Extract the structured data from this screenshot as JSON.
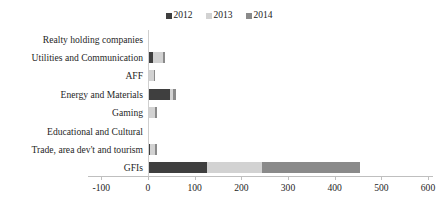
{
  "chart_data": {
    "type": "bar",
    "orientation": "horizontal",
    "stacked": true,
    "title": "",
    "xlabel": "",
    "ylabel": "",
    "xlim": [
      -100,
      600
    ],
    "xticks": [
      -100,
      0,
      100,
      200,
      300,
      400,
      500,
      600
    ],
    "xtick_labels": [
      "-100",
      "0",
      "100",
      "200",
      "300",
      "400",
      "500",
      "600"
    ],
    "grid": false,
    "legend_position": "top-center",
    "categories": [
      "Realty holding companies",
      "Utilities and Communication",
      "AFF",
      "Energy and Materials",
      "Gaming",
      "Educational and Cultural",
      "Trade, area dev't and tourism",
      "GFIs"
    ],
    "series": [
      {
        "name": "2012",
        "color": "#3f3f3f",
        "values": [
          0,
          11,
          2,
          48,
          2,
          0,
          4,
          126
        ]
      },
      {
        "name": "2013",
        "color": "#d2d2d2",
        "values": [
          0,
          21,
          10,
          6,
          14,
          0,
          12,
          118
        ]
      },
      {
        "name": "2014",
        "color": "#8a8a8a",
        "values": [
          0,
          4,
          2,
          5,
          3,
          0,
          3,
          210
        ]
      }
    ],
    "series_totals": [
      0,
      36,
      14,
      59,
      19,
      0,
      19,
      454
    ]
  }
}
